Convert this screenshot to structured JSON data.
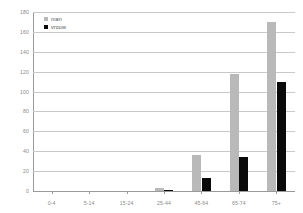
{
  "chart_data": {
    "type": "bar",
    "title": "",
    "subtitle": "",
    "xlabel": "",
    "ylabel": "",
    "categories": [
      "0-4",
      "5-14",
      "15-24",
      "25-44",
      "45-64",
      "65-74",
      "75+"
    ],
    "series": [
      {
        "name": "man",
        "color": "#b9b9b9",
        "values": [
          0,
          0,
          0,
          3,
          36,
          118,
          170
        ]
      },
      {
        "name": "vrouw",
        "color": "#0a0a0a",
        "values": [
          0,
          0,
          0,
          1,
          13,
          34,
          110
        ]
      }
    ],
    "ylim": [
      0,
      180
    ],
    "yticks": [
      0,
      20,
      40,
      60,
      80,
      100,
      120,
      140,
      160,
      180
    ],
    "ytick_labels": [
      "0",
      "20",
      "40",
      "60",
      "80",
      "100",
      "120",
      "140",
      "160",
      "180"
    ],
    "grid": true,
    "legend_position": "top-left",
    "legend": [
      {
        "label": "man",
        "color": "#b9b9b9",
        "swatch": "square-gray"
      },
      {
        "label": "vrouw",
        "color": "#0a0a0a",
        "swatch": "square-black"
      }
    ]
  },
  "colors": {
    "man": "#b9b9b9",
    "vrouw": "#0a0a0a",
    "grid": "#c9c9c9",
    "axis": "#9a9a9a",
    "tick_text": "#8a8a8a",
    "legend_text": "#555555",
    "background": "#ffffff"
  }
}
